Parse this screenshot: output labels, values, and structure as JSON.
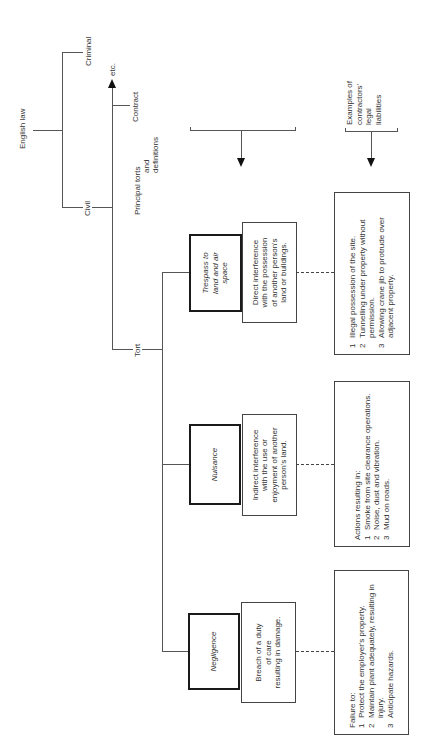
{
  "hierarchy": {
    "root": "English law",
    "branches": [
      "Criminal",
      "Civil"
    ],
    "civil_branches": [
      "Contract",
      "etc.",
      "Tort"
    ]
  },
  "headers": {
    "principal": [
      "Principal torts",
      "and",
      "definitions"
    ],
    "examples": [
      "Examples of",
      "contractors'",
      "legal",
      "liabilities"
    ]
  },
  "torts": [
    {
      "name": "Trespass to land and air space",
      "name_lines": [
        "Trespass to",
        "land and air",
        "space"
      ],
      "definition_lines": [
        "Direct interference",
        "with the possession",
        "of another person's",
        "land or buildings."
      ],
      "examples_intro": "",
      "examples": [
        {
          "num": "1",
          "text": "Illegal possession of the site."
        },
        {
          "num": "2",
          "text": "Tunnelling under property without permission."
        },
        {
          "num": "3",
          "text": "Allowing crane jib to protrude over adjacent property."
        }
      ]
    },
    {
      "name": "Nuisance",
      "name_lines": [
        "Nuisance"
      ],
      "definition_lines": [
        "Indirect interference",
        "with the use or",
        "enjoyment of another",
        "person's land."
      ],
      "examples_intro": "Actions resulting in:",
      "examples": [
        {
          "num": "1",
          "text": "Smoke from site clearance operations."
        },
        {
          "num": "2",
          "text": "Noise, dust and vibration."
        },
        {
          "num": "3",
          "text": "Mud on roads."
        }
      ]
    },
    {
      "name": "Negligence",
      "name_lines": [
        "Negligence"
      ],
      "definition_lines": [
        "Breach of a duty",
        "of care",
        "resulting in damage."
      ],
      "examples_intro": "Failure to:",
      "examples": [
        {
          "num": "1",
          "text": "Protect the employer's property."
        },
        {
          "num": "2",
          "text": "Maintain plant adequately, resulting in injury."
        },
        {
          "num": "3",
          "text": "Anticipate hazards."
        }
      ]
    }
  ],
  "colors": {
    "line": "#555555",
    "tort_border": "#1a1a1a",
    "background": "#ffffff"
  }
}
